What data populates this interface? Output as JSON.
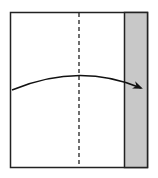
{
  "diagram": {
    "type": "fold-instruction",
    "elements": {
      "paper": {
        "fill": "#ffffff",
        "stroke": "#222222"
      },
      "folded_strip": {
        "fill": "#c8c8c8",
        "stroke": "#222222"
      },
      "fold_line": {
        "style": "dashed",
        "stroke": "#222222"
      },
      "arrow": {
        "direction": "left-to-right",
        "stroke": "#111111"
      }
    }
  }
}
